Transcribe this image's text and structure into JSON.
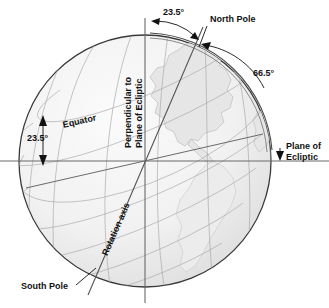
{
  "labels": {
    "tilt_top": "23.5°",
    "north_pole": "North Pole",
    "angle_right": "66.5°",
    "plane_of_ecliptic_line1": "Plane of",
    "plane_of_ecliptic_line2": "Ecliptic",
    "equator": "Equator",
    "tilt_left": "23.5°",
    "perpendicular_line1": "Perpendicular to",
    "perpendicular_line2": "Plane of Ecliptic",
    "rotation_axis": "Rotation axis",
    "south_pole": "South Pole"
  },
  "colors": {
    "ink": "#111111",
    "globe_outline": "#3a3a3a",
    "grid": "#9a9a9a",
    "ocean": "#f2f2f2",
    "land": "#e4e4e4",
    "axis_line": "#555555",
    "ecliptic_line": "#777777",
    "background": "#ffffff"
  },
  "geometry": {
    "center_x": 145,
    "center_y": 161,
    "radius": 126,
    "axis_tilt_degrees": 23.5
  }
}
